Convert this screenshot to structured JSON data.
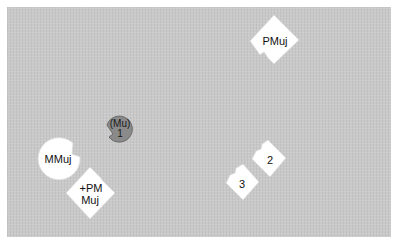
{
  "diagram": {
    "background_color": "#c9c9c9",
    "nodes": [
      {
        "id": "pmuj",
        "shape": "diamond-notched",
        "fill": "#ffffff",
        "label": "PMuj",
        "center": [
          274,
          40
        ]
      },
      {
        "id": "mu1",
        "shape": "circle-notched",
        "fill": "#8a8a8a",
        "label_line1": "(Mu)",
        "label_line2": "1",
        "center": [
          119,
          129
        ]
      },
      {
        "id": "mmuj",
        "shape": "circle-notched",
        "fill": "#ffffff",
        "label": "MMuj",
        "center": [
          59,
          158
        ]
      },
      {
        "id": "pm_muj",
        "shape": "diamond-notched",
        "fill": "#ffffff",
        "label_line1": "+PM",
        "label_line2": "Muj",
        "center": [
          90,
          193
        ]
      },
      {
        "id": "n2",
        "shape": "square-notched",
        "fill": "#ffffff",
        "label": "2",
        "center": [
          269,
          158
        ]
      },
      {
        "id": "n3",
        "shape": "square-notched",
        "fill": "#ffffff",
        "label": "3",
        "center": [
          242,
          182
        ]
      }
    ]
  }
}
